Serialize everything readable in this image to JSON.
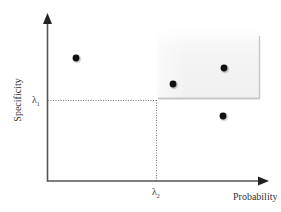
{
  "diagram": {
    "axes": {
      "x_label": "Probability",
      "y_label": "Specificity"
    },
    "thresholds": {
      "lambda1_symbol": "λ",
      "lambda1_sub": "1",
      "lambda2_symbol": "λ",
      "lambda2_sub": "2"
    },
    "region": {
      "description": "shaded acceptance region above λ1 and right of λ2",
      "fill_color": "#f2f2f2",
      "edge_color": "#c8c8c8"
    },
    "points": [
      {
        "id": "p1",
        "x": 76,
        "y": 58,
        "region": "outside"
      },
      {
        "id": "p2",
        "x": 173,
        "y": 84,
        "region": "inside"
      },
      {
        "id": "p3",
        "x": 224,
        "y": 68,
        "region": "inside"
      },
      {
        "id": "p4",
        "x": 223,
        "y": 116,
        "region": "outside"
      }
    ],
    "colors": {
      "axis": "#555555",
      "point": "#111111",
      "dotted": "#777777"
    }
  }
}
